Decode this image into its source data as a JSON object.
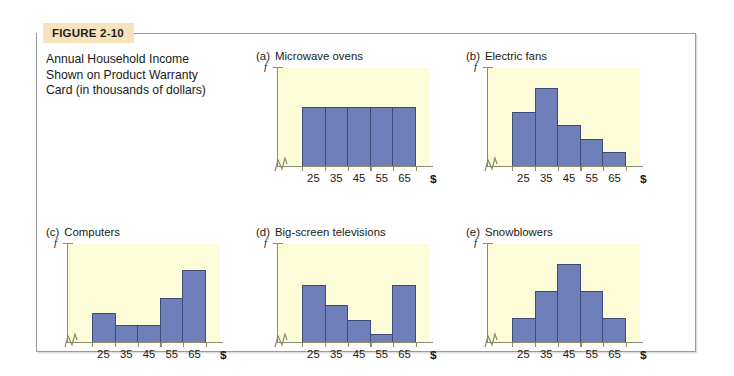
{
  "figure": {
    "tag": "FIGURE 2-10",
    "caption_lines": [
      "Annual Household Income",
      "Shown on Product Warranty",
      "Card (in thousands of dollars)"
    ]
  },
  "colors": {
    "bar_fill": "#6f7fba",
    "bar_stroke": "#3f4a77",
    "plot_background": "#fcfcd9",
    "axis": "#8b8b6e",
    "tag_background": "#f6e3bb",
    "frame_border": "#9a9a9a"
  },
  "axes": {
    "y_label": "f",
    "x_label": "$",
    "tick_labels": [
      "25",
      "35",
      "45",
      "55",
      "65"
    ]
  },
  "chart_data": [
    {
      "type": "bar",
      "panel": "a",
      "panel_letter": "(a)",
      "title": "Microwave ovens",
      "categories": [
        "25",
        "35",
        "45",
        "55",
        "65"
      ],
      "values": [
        60,
        60,
        60,
        60,
        60
      ],
      "ylim": [
        0,
        100
      ],
      "xlabel": "$",
      "ylabel": "f",
      "shape": "uniform",
      "grid": false,
      "legend": "none",
      "y_axis_break": true
    },
    {
      "type": "bar",
      "panel": "b",
      "panel_letter": "(b)",
      "title": "Electric fans",
      "categories": [
        "25",
        "35",
        "45",
        "55",
        "65"
      ],
      "values": [
        55,
        80,
        42,
        28,
        14
      ],
      "ylim": [
        0,
        100
      ],
      "xlabel": "$",
      "ylabel": "f",
      "shape": "skewed-right",
      "grid": false,
      "legend": "none",
      "y_axis_break": true
    },
    {
      "type": "bar",
      "panel": "c",
      "panel_letter": "(c)",
      "title": "Computers",
      "categories": [
        "25",
        "35",
        "45",
        "55",
        "65"
      ],
      "values": [
        30,
        17,
        17,
        45,
        73
      ],
      "ylim": [
        0,
        100
      ],
      "xlabel": "$",
      "ylabel": "f",
      "shape": "skewed-left",
      "grid": false,
      "legend": "none",
      "y_axis_break": true
    },
    {
      "type": "bar",
      "panel": "d",
      "panel_letter": "(d)",
      "title": "Big-screen televisions",
      "categories": [
        "25",
        "35",
        "45",
        "55",
        "65"
      ],
      "values": [
        58,
        38,
        22,
        8,
        58
      ],
      "ylim": [
        0,
        100
      ],
      "xlabel": "$",
      "ylabel": "f",
      "shape": "bimodal",
      "grid": false,
      "legend": "none",
      "y_axis_break": true
    },
    {
      "type": "bar",
      "panel": "e",
      "panel_letter": "(e)",
      "title": "Snowblowers",
      "categories": [
        "25",
        "35",
        "45",
        "55",
        "65"
      ],
      "values": [
        25,
        52,
        80,
        52,
        25
      ],
      "ylim": [
        0,
        100
      ],
      "xlabel": "$",
      "ylabel": "f",
      "shape": "symmetric",
      "grid": false,
      "legend": "none",
      "y_axis_break": true
    }
  ]
}
